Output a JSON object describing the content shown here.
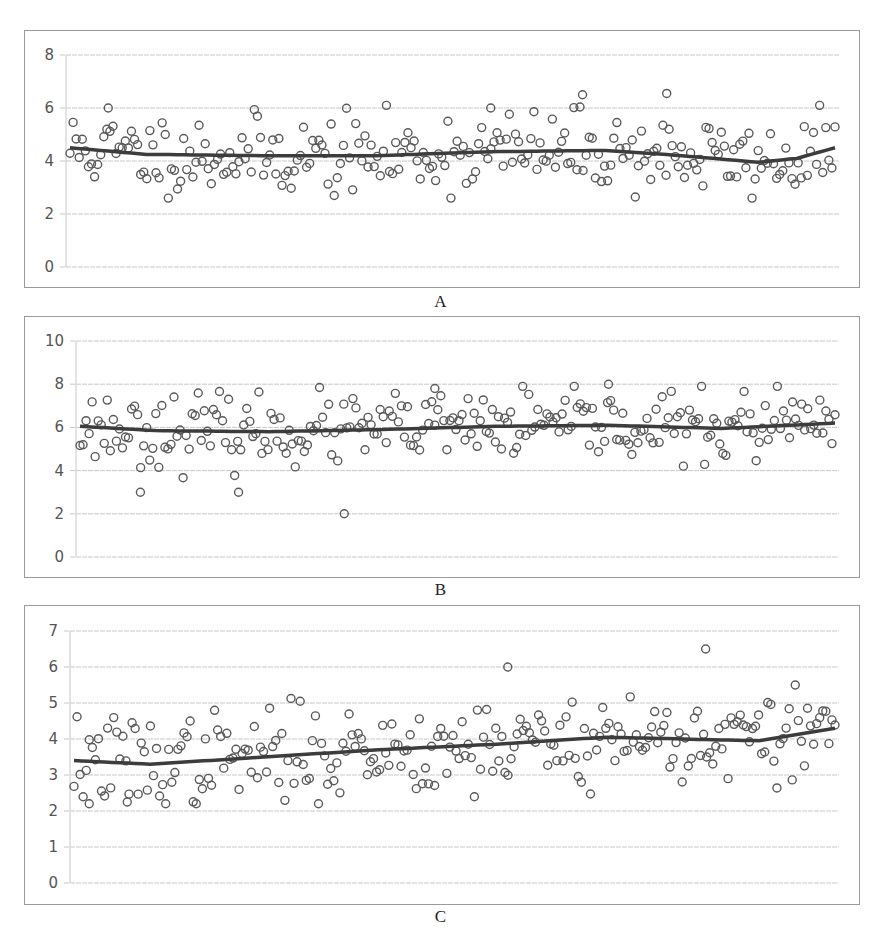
{
  "figure": {
    "panels": [
      {
        "id": "A",
        "label": "A"
      },
      {
        "id": "B",
        "label": "B"
      },
      {
        "id": "C",
        "label": "C"
      }
    ]
  },
  "chart_data": [
    {
      "type": "scatter",
      "title": "A",
      "xlabel": "",
      "ylabel": "",
      "ylim": [
        0,
        8
      ],
      "yticks": [
        0,
        2,
        4,
        6,
        8
      ],
      "grid": true,
      "legend": "none",
      "n_points_approx": 250,
      "marker": "open-circle",
      "trendline": {
        "type": "smoothed",
        "source": "read-from-image",
        "x_frac": [
          0.0,
          0.1,
          0.25,
          0.4,
          0.55,
          0.7,
          0.8,
          0.9,
          0.95,
          1.0
        ],
        "y": [
          4.5,
          4.25,
          4.2,
          4.2,
          4.35,
          4.4,
          4.2,
          3.95,
          4.1,
          4.5
        ]
      },
      "observed": {
        "source": "read-from-image",
        "band_typical": [
          3.0,
          5.5
        ],
        "outliers": [
          {
            "x_frac": 0.67,
            "y": 6.5
          },
          {
            "x_frac": 0.78,
            "y": 6.55
          },
          {
            "x_frac": 0.05,
            "y": 6.0
          },
          {
            "x_frac": 0.55,
            "y": 6.0
          }
        ]
      },
      "points_source": "reconstructed",
      "points_note": "Individual point values are synthesized to match the observed band, trendline and outliers; they are not digitized from the image.",
      "reconstruction": {
        "seed": 11,
        "n": 250,
        "sd": 0.75,
        "clip": [
          2.6,
          6.1
        ]
      }
    },
    {
      "type": "scatter",
      "title": "B",
      "xlabel": "",
      "ylabel": "",
      "ylim": [
        0,
        10
      ],
      "yticks": [
        0,
        2,
        4,
        6,
        8,
        10
      ],
      "grid": true,
      "legend": "none",
      "n_points_approx": 250,
      "marker": "open-circle",
      "trendline": {
        "type": "smoothed",
        "source": "read-from-image",
        "x_frac": [
          0.0,
          0.1,
          0.25,
          0.4,
          0.55,
          0.7,
          0.85,
          1.0
        ],
        "y": [
          6.05,
          5.85,
          5.8,
          5.9,
          6.05,
          6.1,
          5.95,
          6.2
        ]
      },
      "observed": {
        "source": "read-from-image",
        "band_typical": [
          4.5,
          7.5
        ],
        "outliers": [
          {
            "x_frac": 0.35,
            "y": 2.0
          },
          {
            "x_frac": 0.08,
            "y": 3.0
          },
          {
            "x_frac": 0.21,
            "y": 3.0
          },
          {
            "x_frac": 0.7,
            "y": 8.0
          },
          {
            "x_frac": 0.47,
            "y": 7.8
          }
        ]
      },
      "points_source": "reconstructed",
      "points_note": "Individual point values are synthesized to match the observed band, trendline and outliers; they are not digitized from the image.",
      "reconstruction": {
        "seed": 23,
        "n": 250,
        "sd": 0.8,
        "clip": [
          3.6,
          7.9
        ]
      }
    },
    {
      "type": "scatter",
      "title": "C",
      "xlabel": "",
      "ylabel": "",
      "ylim": [
        0,
        7
      ],
      "yticks": [
        0,
        1,
        2,
        3,
        4,
        5,
        6,
        7
      ],
      "grid": true,
      "legend": "none",
      "n_points_approx": 250,
      "marker": "open-circle",
      "trendline": {
        "type": "smoothed",
        "source": "read-from-image",
        "x_frac": [
          0.0,
          0.1,
          0.25,
          0.4,
          0.55,
          0.7,
          0.8,
          0.9,
          1.0
        ],
        "y": [
          3.4,
          3.3,
          3.5,
          3.7,
          3.85,
          4.05,
          4.0,
          3.95,
          4.3
        ]
      },
      "observed": {
        "source": "read-from-image",
        "band_typical": [
          2.5,
          5.2
        ],
        "outliers": [
          {
            "x_frac": 0.83,
            "y": 6.5
          },
          {
            "x_frac": 0.57,
            "y": 6.0
          },
          {
            "x_frac": 0.02,
            "y": 2.2
          },
          {
            "x_frac": 0.07,
            "y": 2.25
          }
        ]
      },
      "points_source": "reconstructed",
      "points_note": "Individual point values are synthesized to match the observed band, trendline and outliers; they are not digitized from the image.",
      "reconstruction": {
        "seed": 37,
        "n": 250,
        "sd": 0.65,
        "clip": [
          2.2,
          5.6
        ]
      }
    }
  ],
  "layout": {
    "panels": [
      {
        "top": 30,
        "height": 258,
        "plot_x0": 41,
        "plot_x1": 814,
        "y_top_px": 24,
        "y_bottom_px": 236,
        "label_top": 292
      },
      {
        "top": 316,
        "height": 262,
        "plot_x0": 51,
        "plot_x1": 814,
        "y_top_px": 24,
        "y_bottom_px": 240,
        "label_top": 580
      },
      {
        "top": 605,
        "height": 300,
        "plot_x0": 45,
        "plot_x1": 814,
        "y_top_px": 25,
        "y_bottom_px": 277,
        "label_top": 907
      }
    ],
    "colors": {
      "marker": "#5a5a5a",
      "trend": "#3c3c3c",
      "grid": "#c8c8c8",
      "frame": "#9a9a9a"
    }
  }
}
